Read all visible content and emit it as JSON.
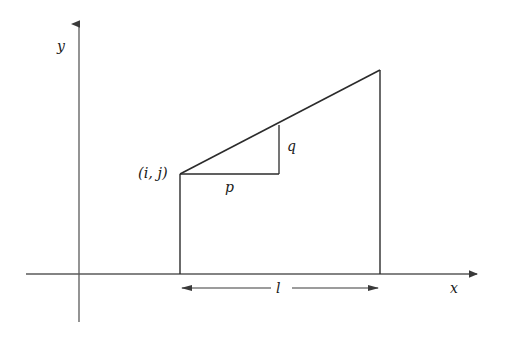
{
  "figure": {
    "type": "geometry-diagram",
    "background_color": "#ffffff",
    "stroke_color": "#2b2b2b",
    "axis_color": "#555555"
  },
  "axes": {
    "y_axis_label": "y",
    "x_axis_label": "x",
    "y_axis": {
      "x": 79,
      "y_top": 21,
      "y_bottom": 322,
      "arrow": "up"
    },
    "x_axis": {
      "y": 274,
      "x_left": 26,
      "x_right": 481,
      "arrow": "right"
    }
  },
  "shape": {
    "name": "trapezoid",
    "vertex_label": "(i, j)",
    "vertices": [
      {
        "name": "left-base",
        "x": 180,
        "y": 274
      },
      {
        "name": "left-top",
        "x": 180,
        "y": 174
      },
      {
        "name": "right-top",
        "x": 380,
        "y": 70
      },
      {
        "name": "right-base",
        "x": 380,
        "y": 274
      }
    ]
  },
  "slope_triangle": {
    "run_label": "p",
    "rise_label": "q",
    "run_line": {
      "x1": 180,
      "y1": 174,
      "x2": 279,
      "y2": 174
    },
    "rise_line": {
      "x1": 279,
      "y1": 174,
      "x2": 279,
      "y2": 125
    }
  },
  "dimension": {
    "label": "l",
    "y": 288,
    "x_start": 180,
    "x_end": 380,
    "gap_start": 271,
    "gap_end": 292,
    "arrows": "both"
  }
}
